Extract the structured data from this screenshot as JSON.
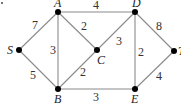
{
  "diagram": {
    "type": "weighted-undirected-graph",
    "nodes": [
      {
        "id": "S",
        "label": "S",
        "x": 19,
        "y": 50
      },
      {
        "id": "A",
        "label": "A",
        "x": 58,
        "y": 12
      },
      {
        "id": "B",
        "label": "B",
        "x": 58,
        "y": 89
      },
      {
        "id": "C",
        "label": "C",
        "x": 97,
        "y": 50
      },
      {
        "id": "D",
        "label": "D",
        "x": 135,
        "y": 12
      },
      {
        "id": "E",
        "label": "E",
        "x": 135,
        "y": 89
      },
      {
        "id": "T",
        "label": "T",
        "x": 174,
        "y": 51
      }
    ],
    "edges": [
      {
        "from": "S",
        "to": "A",
        "weight": "7"
      },
      {
        "from": "S",
        "to": "B",
        "weight": "5"
      },
      {
        "from": "A",
        "to": "B",
        "weight": "3"
      },
      {
        "from": "A",
        "to": "C",
        "weight": "2"
      },
      {
        "from": "A",
        "to": "D",
        "weight": "4"
      },
      {
        "from": "B",
        "to": "C",
        "weight": "2"
      },
      {
        "from": "B",
        "to": "E",
        "weight": "3"
      },
      {
        "from": "C",
        "to": "D",
        "weight": "3"
      },
      {
        "from": "D",
        "to": "E",
        "weight": "2"
      },
      {
        "from": "D",
        "to": "T",
        "weight": "8"
      },
      {
        "from": "E",
        "to": "T",
        "weight": "4"
      }
    ]
  }
}
